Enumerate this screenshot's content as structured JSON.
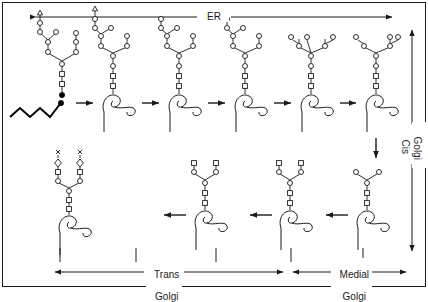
{
  "figure": {
    "title_region_top": "ER",
    "compartment_labels": {
      "er": "ER",
      "cis_line1": "Cis",
      "cis_line2": "Golgi",
      "medial_line1": "Medial",
      "medial_line2": "Golgi",
      "trans_line1": "Trans",
      "trans_line2": "Golgi"
    },
    "colors": {
      "stroke": "#1a1a1a",
      "fill_open": "#ffffff",
      "fill_solid": "#000000",
      "background": "#ffffff",
      "border": "#1a1a1a"
    },
    "glyph_legend": [
      {
        "name": "triangle",
        "shape": "triangle",
        "meaning": "glucose"
      },
      {
        "name": "circle",
        "shape": "circle",
        "meaning": "mannose"
      },
      {
        "name": "square",
        "shape": "square",
        "meaning": "n-acetylglucosamine"
      },
      {
        "name": "diamond",
        "shape": "diamond",
        "meaning": "sialic-acid"
      },
      {
        "name": "x-mark",
        "shape": "x",
        "meaning": "terminal-marker"
      },
      {
        "name": "filled-circle",
        "shape": "filled-circle",
        "meaning": "phosphate"
      },
      {
        "name": "zigzag",
        "shape": "zigzag",
        "meaning": "dolichol-lipid"
      }
    ],
    "rows": [
      {
        "name": "top-row",
        "direction": "left-to-right",
        "steps": [
          {
            "index": 1,
            "name": "dolichol-linked-precursor",
            "has_protein": false,
            "has_lipid": true,
            "glucose_count": 3,
            "mannose_count": 9,
            "glcnac_count": 2
          },
          {
            "index": 2,
            "name": "protein-transferred-glycan",
            "has_protein": true,
            "has_lipid": false,
            "glucose_count": 3,
            "mannose_count": 9,
            "glcnac_count": 2
          },
          {
            "index": 3,
            "name": "glucose-trimmed-1",
            "has_protein": true,
            "has_lipid": false,
            "glucose_count": 1,
            "mannose_count": 9,
            "glcnac_count": 2
          },
          {
            "index": 4,
            "name": "glucose-trimmed-2",
            "has_protein": true,
            "has_lipid": false,
            "glucose_count": 1,
            "mannose_count": 8,
            "glcnac_count": 2
          },
          {
            "index": 5,
            "name": "mannose-trimmed-1",
            "has_protein": true,
            "has_lipid": false,
            "glucose_count": 0,
            "mannose_count": 8,
            "glcnac_count": 2
          },
          {
            "index": 6,
            "name": "mannose-trimmed-2",
            "has_protein": true,
            "has_lipid": false,
            "glucose_count": 0,
            "mannose_count": 7,
            "glcnac_count": 2
          }
        ]
      },
      {
        "name": "bottom-row",
        "direction": "right-to-left",
        "steps": [
          {
            "index": 7,
            "name": "high-mannose-core",
            "has_protein": true,
            "mannose_count": 3,
            "glcnac_count": 2
          },
          {
            "index": 8,
            "name": "glcnac-added",
            "has_protein": true,
            "mannose_count": 3,
            "glcnac_count": 4
          },
          {
            "index": 9,
            "name": "hybrid-complex",
            "has_protein": true,
            "mannose_count": 3,
            "glcnac_count": 4
          },
          {
            "index": 10,
            "name": "sialylated-complex",
            "has_protein": true,
            "mannose_count": 3,
            "glcnac_count": 4,
            "sialic_count": 2
          }
        ]
      }
    ]
  }
}
